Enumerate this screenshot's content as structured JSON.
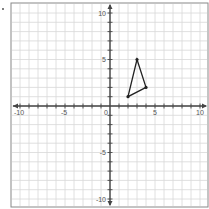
{
  "question": {
    "bullet_marker": "•"
  },
  "chart_data": {
    "type": "scatter",
    "title": "",
    "xlabel": "",
    "ylabel": "",
    "xlim": [
      -10.5,
      10.5
    ],
    "ylim": [
      -11,
      11
    ],
    "grid": true,
    "grid_minor_step": 1,
    "x_tick_labels": [
      "-10",
      "-5",
      "0",
      "5",
      "10"
    ],
    "y_tick_labels": [
      "10",
      "5",
      "-5",
      "-10"
    ],
    "x_tick_values": [
      -10,
      -5,
      0,
      5,
      10
    ],
    "y_tick_values": [
      10,
      5,
      -5,
      -10
    ],
    "shape": "triangle",
    "series": [
      {
        "name": "triangle",
        "closed": true,
        "points": [
          {
            "x": 2,
            "y": 1
          },
          {
            "x": 3,
            "y": 5
          },
          {
            "x": 4,
            "y": 2
          }
        ]
      }
    ],
    "colors": {
      "grid": "#d8d8d8",
      "axis": "#444444",
      "border": "#888888",
      "shape": "#222222",
      "label": "#555555"
    }
  }
}
